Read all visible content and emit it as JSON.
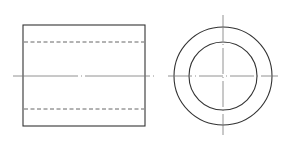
{
  "diagram": {
    "type": "orthographic-projection",
    "views": [
      {
        "name": "front-view",
        "shape": "rectangle",
        "hidden_lines": 2,
        "centerline": "horizontal"
      },
      {
        "name": "side-view",
        "shape": "concentric-circles",
        "circles": 2,
        "centerlines": [
          "horizontal",
          "vertical"
        ]
      }
    ],
    "colors": {
      "outline": "#333333",
      "hidden": "#555555",
      "center": "#777777",
      "background": "#ffffff"
    }
  }
}
